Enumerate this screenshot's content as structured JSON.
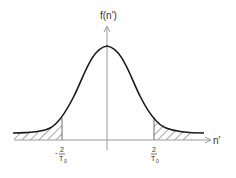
{
  "diagram": {
    "type": "gaussian-distribution",
    "y_axis_label": "f(n')",
    "x_axis_label": "n'",
    "left_tick": {
      "sign": "-",
      "numerator": "2",
      "denominator": "T",
      "subscript": "0"
    },
    "right_tick": {
      "numerator": "2",
      "denominator": "T",
      "subscript": "0"
    },
    "shaded_regions": [
      "left-tail",
      "right-tail"
    ],
    "colors": {
      "curve": "#1a1a1a",
      "axis": "#9a9a9a",
      "hatch": "#6a6a6a",
      "text": "#333333"
    }
  }
}
